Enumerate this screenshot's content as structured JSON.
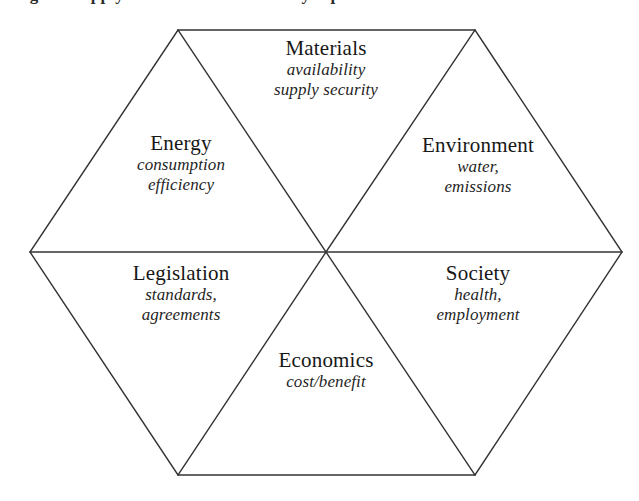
{
  "caption": {
    "text": "Figure: supply-chain and sustainability aspects"
  },
  "diagram": {
    "type": "hexagon-six-sector",
    "line_color": "#333333",
    "background_color": "#ffffff",
    "text_color": "#1c1c1c",
    "sectors": [
      {
        "id": "materials",
        "position": "top",
        "title": "Materials",
        "sub_line_1": "availability",
        "sub_line_2": "supply security"
      },
      {
        "id": "energy",
        "position": "upper-left",
        "title": "Energy",
        "sub_line_1": "consumption",
        "sub_line_2": "efficiency"
      },
      {
        "id": "environment",
        "position": "upper-right",
        "title": "Environment",
        "sub_line_1": "water,",
        "sub_line_2": "emissions"
      },
      {
        "id": "legislation",
        "position": "lower-left",
        "title": "Legislation",
        "sub_line_1": "standards,",
        "sub_line_2": "agreements"
      },
      {
        "id": "society",
        "position": "lower-right",
        "title": "Society",
        "sub_line_1": "health,",
        "sub_line_2": "employment"
      },
      {
        "id": "economics",
        "position": "bottom",
        "title": "Economics",
        "sub_line_1": "cost/benefit",
        "sub_line_2": ""
      }
    ],
    "geometry": {
      "vertex_top_left": "178,30",
      "vertex_top_right": "475,30",
      "vertex_right": "622,252",
      "vertex_bottom_right": "475,475",
      "vertex_bottom_left": "178,475",
      "vertex_left": "30,252",
      "center": "326,252"
    }
  }
}
